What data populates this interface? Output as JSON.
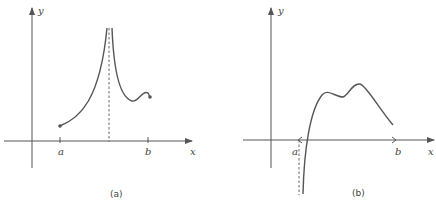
{
  "figure": {
    "panel_a": {
      "caption": "(a)",
      "x_axis_label": "x",
      "y_axis_label": "y",
      "tick_labels": [
        "a",
        "b"
      ],
      "description": "Function on closed interval [a,b] with vertical asymptote inside the interval; curve rises from a filled endpoint at a toward +infinity at asymptote, then descends from +infinity to a local min, small local max, ending at filled endpoint at b"
    },
    "panel_b": {
      "caption": "(b)",
      "x_axis_label": "x",
      "y_axis_label": "y",
      "tick_labels": [
        "a",
        "b"
      ],
      "description": "Function on open interval (a,b) with vertical asymptote at x=a going to -infinity; curve rises, has two local maxima with a local min between, then decreases toward b"
    }
  }
}
